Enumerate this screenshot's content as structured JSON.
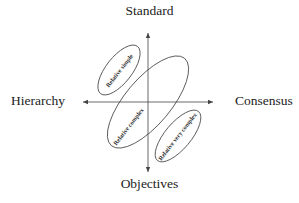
{
  "diagram": {
    "axes": {
      "top": "Standard",
      "bottom": "Objectives",
      "left": "Hierarchy",
      "right": "Consensus"
    },
    "regions": [
      {
        "label": "Relative simple",
        "quadrant": "upper-left"
      },
      {
        "label": "Relative complex",
        "quadrant": "center"
      },
      {
        "label": "Relative very complex",
        "quadrant": "lower-right"
      }
    ],
    "colors": {
      "line": "#444444",
      "text": "#222222"
    }
  }
}
